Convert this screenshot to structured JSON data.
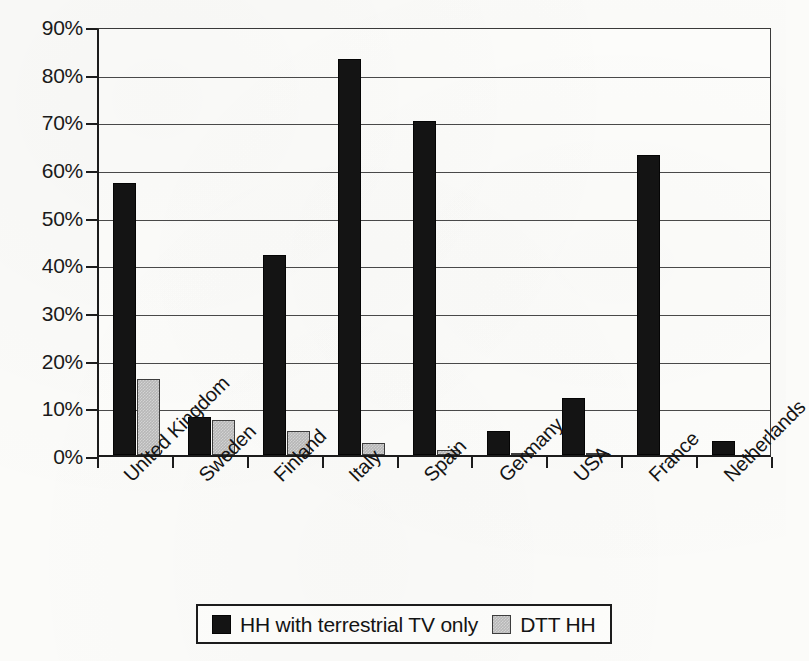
{
  "chart_data": {
    "type": "bar",
    "title": "",
    "xlabel": "",
    "ylabel": "",
    "ylim": [
      0,
      90
    ],
    "ytick_labels": [
      "90%",
      "80%",
      "70%",
      "60%",
      "50%",
      "40%",
      "30%",
      "20%",
      "10%",
      "0%"
    ],
    "ytick_values": [
      90,
      80,
      70,
      60,
      50,
      40,
      30,
      20,
      10,
      0
    ],
    "grid": true,
    "legend_position": "bottom",
    "categories": [
      "United Kingdom",
      "Sweden",
      "Finland",
      "Italy",
      "Spain",
      "Germany",
      "USA",
      "France",
      "Netherlands"
    ],
    "series": [
      {
        "name": "HH with terrestrial TV only",
        "color": "#141414",
        "values": [
          57,
          8,
          42,
          83,
          70,
          5,
          12,
          63,
          3
        ]
      },
      {
        "name": "DTT HH",
        "color": "#b9b9b9",
        "values": [
          16,
          7.3,
          5,
          2.5,
          1,
          0.3,
          0.2,
          0,
          0
        ]
      }
    ]
  },
  "legend": {
    "entries": [
      {
        "label": "HH with terrestrial TV only",
        "swatch": "black-square-icon"
      },
      {
        "label": "DTT HH",
        "swatch": "gray-square-icon"
      }
    ]
  }
}
